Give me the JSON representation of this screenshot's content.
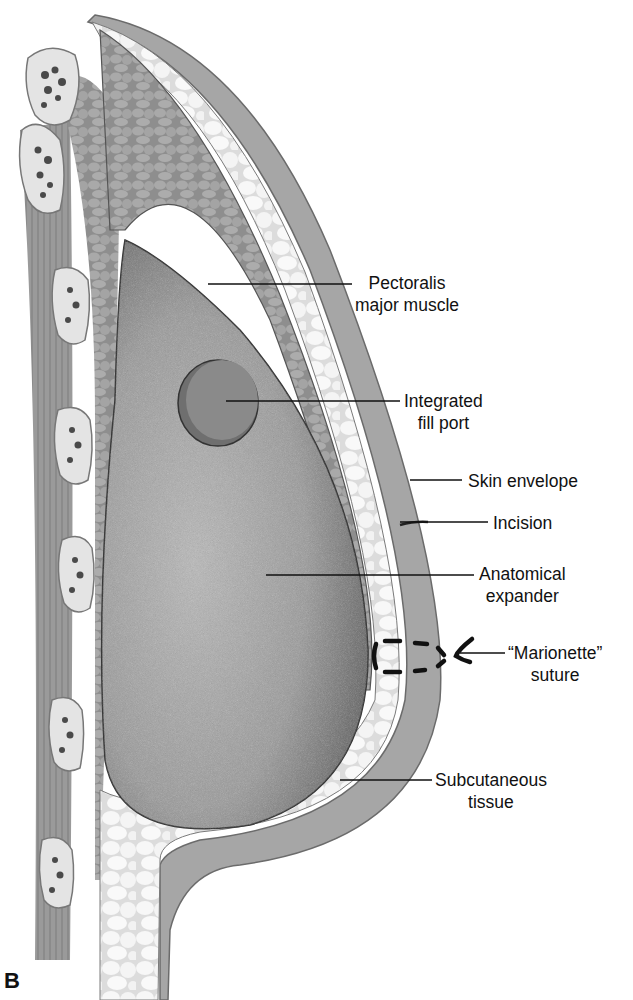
{
  "figure": {
    "panel_letter": "B",
    "labels": [
      {
        "id": "pectoralis",
        "lines": [
          "Pectoralis",
          "major muscle"
        ]
      },
      {
        "id": "fill-port",
        "lines": [
          "Integrated",
          "fill port"
        ]
      },
      {
        "id": "skin",
        "lines": [
          "Skin envelope"
        ]
      },
      {
        "id": "incision",
        "lines": [
          "Incision"
        ]
      },
      {
        "id": "expander",
        "lines": [
          "Anatomical",
          "expander"
        ]
      },
      {
        "id": "marionette",
        "lines": [
          "“Marionette”",
          "suture"
        ]
      },
      {
        "id": "subcutaneous",
        "lines": [
          "Subcutaneous",
          "tissue"
        ]
      }
    ]
  }
}
